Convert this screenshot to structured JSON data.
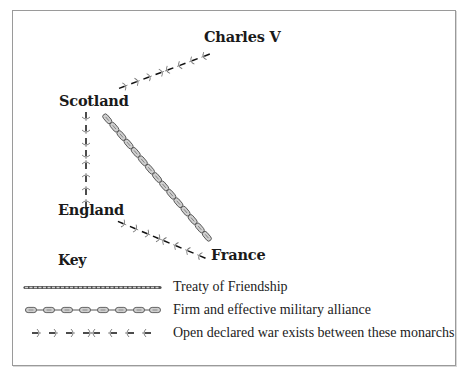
{
  "diagram": {
    "nodes": [
      {
        "id": "charles_v",
        "label": "Charles V"
      },
      {
        "id": "scotland",
        "label": "Scotland"
      },
      {
        "id": "england",
        "label": "England"
      },
      {
        "id": "france",
        "label": "France"
      }
    ],
    "edges": [
      {
        "from": "Scotland",
        "to": "Charles V",
        "type": "Open declared war exists between these monarchs"
      },
      {
        "from": "Scotland",
        "to": "England",
        "type": "Open declared war exists between these monarchs"
      },
      {
        "from": "Scotland",
        "to": "France",
        "type": "Firm and effective military alliance"
      },
      {
        "from": "England",
        "to": "France",
        "type": "Open declared war exists between these monarchs"
      }
    ]
  },
  "key": {
    "title": "Key",
    "items": [
      {
        "symbol": "twisted-rope-line",
        "label": "Treaty of Friendship"
      },
      {
        "symbol": "chain-link-line",
        "label": "Firm and effective military alliance"
      },
      {
        "symbol": "opposing-arrows-line",
        "label": "Open declared war exists between these monarchs"
      }
    ]
  },
  "colors": {
    "border": "#9a9a9a",
    "text": "#1a1a1a",
    "chain_fill": "#c8c8c8",
    "chain_stroke": "#555555",
    "war_line": "#1a1a1a",
    "arrowhead": "#888888"
  }
}
